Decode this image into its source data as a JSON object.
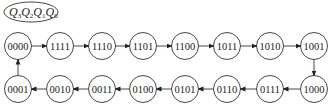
{
  "label": {
    "text": "Q3Q2Q1Q0",
    "parts": [
      {
        "base": "Q",
        "sub": "3"
      },
      {
        "base": "Q",
        "sub": "2"
      },
      {
        "base": "Q",
        "sub": "1"
      },
      {
        "base": "Q",
        "sub": "0"
      }
    ]
  },
  "states_top": [
    "0000",
    "1111",
    "1110",
    "1101",
    "1100",
    "1011",
    "1010",
    "1001"
  ],
  "states_bottom": [
    "0001",
    "0010",
    "0011",
    "0100",
    "0101",
    "0110",
    "0111",
    "1000"
  ],
  "sequence": [
    "0000",
    "1111",
    "1110",
    "1101",
    "1100",
    "1011",
    "1010",
    "1001",
    "1000",
    "0111",
    "0110",
    "0101",
    "0100",
    "0011",
    "0010",
    "0001",
    "0000"
  ],
  "colors": {
    "stroke": "#333333",
    "text": "#222222",
    "background": "#ffffff"
  }
}
